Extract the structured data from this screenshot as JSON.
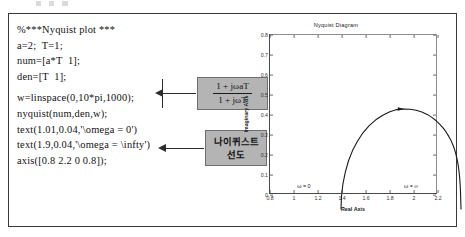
{
  "figure": {
    "code_lines": [
      "%***Nyquist plot ***",
      "a=2;  T=1;",
      "num=[a*T  1];",
      "den=[T  1];",
      "w=linspace(0,10*pi,1000);",
      "nyquist(num,den,w);",
      "text(1.01,0.04,'\\omega = 0')",
      "text(1.9,0.04,'\\omega = \\infty')",
      "axis([0.8 2.2 0 0.8]);"
    ],
    "annotations": {
      "formula_numerator": "1 + jωaT",
      "formula_denominator": "1 + jωT",
      "korean_line1": "나이퀴스트",
      "korean_line2": "선도"
    }
  },
  "chart_data": {
    "type": "line",
    "title": "Nyquist Diagram",
    "xlabel": "Real Axis",
    "ylabel": "Imaginary Axis",
    "xlim": [
      0.8,
      2.2
    ],
    "ylim": [
      0,
      0.8
    ],
    "xticks": [
      "0.8",
      "1",
      "1.2",
      "1.4",
      "1.6",
      "1.8",
      "2",
      "2.2"
    ],
    "xtick_values": [
      0.8,
      1.0,
      1.2,
      1.4,
      1.6,
      1.8,
      2.0,
      2.2
    ],
    "yticks": [
      "0",
      "0.1",
      "0.2",
      "0.3",
      "0.4",
      "0.5",
      "0.6",
      "0.7",
      "0.8"
    ],
    "ytick_values": [
      0,
      0.1,
      0.2,
      0.3,
      0.4,
      0.5,
      0.6,
      0.7,
      0.8
    ],
    "grid": false,
    "legend": null,
    "series": [
      {
        "name": "G(jω) = (1 + jω·2)/(1 + jω)",
        "x": [
          1.0,
          1.004,
          1.016,
          1.036,
          1.062,
          1.096,
          1.137,
          1.183,
          1.235,
          1.29,
          1.348,
          1.407,
          1.465,
          1.522,
          1.576,
          1.627,
          1.674,
          1.718,
          1.757,
          1.793,
          1.824,
          1.852,
          1.877,
          1.898,
          1.917,
          1.933,
          1.947,
          1.958,
          1.968,
          1.977,
          1.984,
          1.99,
          1.995,
          2.0
        ],
        "y": [
          0.0,
          0.063,
          0.125,
          0.184,
          0.24,
          0.292,
          0.339,
          0.381,
          0.417,
          0.446,
          0.469,
          0.486,
          0.497,
          0.5,
          0.499,
          0.494,
          0.485,
          0.473,
          0.458,
          0.441,
          0.423,
          0.404,
          0.384,
          0.363,
          0.342,
          0.32,
          0.297,
          0.273,
          0.247,
          0.218,
          0.186,
          0.148,
          0.1,
          0.0
        ]
      }
    ],
    "markers": [
      {
        "name": "direction-arrow",
        "x": 1.5,
        "y": 0.5
      }
    ],
    "text_annotations": [
      {
        "name": "omega-zero-label",
        "text": "ω = 0",
        "x": 1.01,
        "y": 0.04
      },
      {
        "name": "omega-infinity-label",
        "text": "ω = ∞",
        "x": 1.9,
        "y": 0.04
      }
    ]
  }
}
